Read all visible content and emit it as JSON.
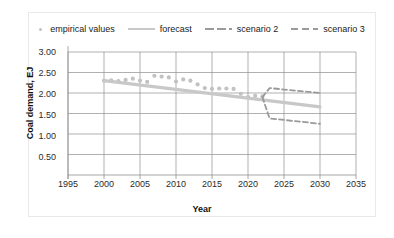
{
  "legend": {
    "position": "top-center",
    "items": [
      {
        "label": "empirical values",
        "marker": "scatter-dot",
        "color": "#c2c2c2"
      },
      {
        "label": "forecast",
        "marker": "solid-line",
        "color": "#c8c8c8"
      },
      {
        "label": "scenario 2",
        "marker": "dashed-line",
        "color": "#9a9a9a"
      },
      {
        "label": "scenario 3",
        "marker": "dashed-line",
        "color": "#9a9a9a"
      }
    ]
  },
  "axes": {
    "x": {
      "title": "Year",
      "ticks": [
        "1995",
        "2000",
        "2005",
        "2010",
        "2015",
        "2020",
        "2025",
        "2030",
        "2035"
      ],
      "min": 1995,
      "max": 2035
    },
    "y": {
      "title": "Coal demand, EJ",
      "ticks": [
        "0.50",
        "1.00",
        "1.50",
        "2.00",
        "2.50",
        "3.00"
      ],
      "min": 0,
      "max": 3.0
    }
  },
  "chart_data": {
    "type": "scatter",
    "title": "",
    "xlabel": "Year",
    "ylabel": "Coal demand, EJ",
    "xlim": [
      1995,
      2035
    ],
    "ylim": [
      0,
      3.0
    ],
    "xticks": [
      1995,
      2000,
      2005,
      2010,
      2015,
      2020,
      2025,
      2030,
      2035
    ],
    "yticks": [
      0.5,
      1.0,
      1.5,
      2.0,
      2.5,
      3.0
    ],
    "grid": true,
    "legend_position": "top-center",
    "series": [
      {
        "name": "empirical values",
        "type": "scatter",
        "color": "#c2c2c2",
        "x": [
          2000,
          2001,
          2002,
          2003,
          2004,
          2005,
          2006,
          2007,
          2008,
          2009,
          2010,
          2011,
          2012,
          2013,
          2014,
          2015,
          2016,
          2017,
          2018,
          2019,
          2020,
          2021,
          2022
        ],
        "y": [
          2.3,
          2.31,
          2.29,
          2.32,
          2.35,
          2.3,
          2.27,
          2.42,
          2.4,
          2.38,
          2.28,
          2.33,
          2.3,
          2.21,
          2.12,
          2.1,
          2.11,
          2.11,
          2.1,
          1.98,
          1.9,
          1.93,
          1.92
        ]
      },
      {
        "name": "forecast",
        "type": "line",
        "style": "solid",
        "color": "#c8c8c8",
        "x": [
          2000,
          2030
        ],
        "y": [
          2.3,
          1.66
        ]
      },
      {
        "name": "scenario 2",
        "type": "line",
        "style": "dashed",
        "color": "#9a9a9a",
        "x": [
          2022,
          2023,
          2030
        ],
        "y": [
          1.9,
          2.12,
          2.0
        ]
      },
      {
        "name": "scenario 3",
        "type": "line",
        "style": "dashed",
        "color": "#9a9a9a",
        "x": [
          2022,
          2023,
          2030
        ],
        "y": [
          1.9,
          1.38,
          1.25
        ]
      }
    ]
  }
}
